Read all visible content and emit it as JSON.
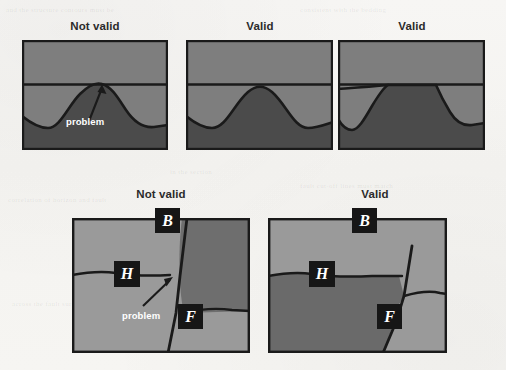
{
  "figure": {
    "background_color": "#f6f5f3",
    "ink_color": "#1a1a1a",
    "light_gray": "#7e7e7e",
    "dark_gray": "#4b4b4b",
    "pale_gray": "#9a9a9a"
  },
  "ghost_text": [
    {
      "text": "and the structure contours must be",
      "x": 6,
      "y": 6
    },
    {
      "text": "consistent with the bedding",
      "x": 300,
      "y": 6
    },
    {
      "text": "in the section",
      "x": 170,
      "y": 168
    },
    {
      "text": "fault cut-off lines must match",
      "x": 300,
      "y": 182
    },
    {
      "text": "correlation of horizon and fault",
      "x": 8,
      "y": 196
    },
    {
      "text": "across the fault surface",
      "x": 12,
      "y": 300
    },
    {
      "text": "geometry of the hanging wall",
      "x": 300,
      "y": 330
    }
  ],
  "top_row": {
    "panels": [
      {
        "id": "top-panel-1",
        "title": "Not valid",
        "title_x": 60,
        "title_y": 20,
        "title_w": 70,
        "rect": {
          "x": 22,
          "y": 40,
          "w": 146,
          "h": 110
        },
        "annotation": {
          "label": "problem",
          "x": 66,
          "y": 116
        },
        "has_arrow": true
      },
      {
        "id": "top-panel-2",
        "title": "Valid",
        "title_x": 225,
        "title_y": 20,
        "title_w": 70,
        "rect": {
          "x": 186,
          "y": 40,
          "w": 147,
          "h": 110
        },
        "annotation": null,
        "has_arrow": false
      },
      {
        "id": "top-panel-3",
        "title": "Valid",
        "title_x": 377,
        "title_y": 20,
        "title_w": 70,
        "rect": {
          "x": 338,
          "y": 40,
          "w": 147,
          "h": 110
        },
        "annotation": null,
        "has_arrow": false
      }
    ]
  },
  "bottom_row": {
    "panels": [
      {
        "id": "bottom-panel-1",
        "title": "Not valid",
        "title_x": 126,
        "title_y": 188,
        "title_w": 70,
        "rect": {
          "x": 72,
          "y": 218,
          "w": 178,
          "h": 135
        },
        "labels": [
          {
            "text": "B",
            "x": 155,
            "y": 208,
            "w": 25,
            "h": 25
          },
          {
            "text": "H",
            "x": 114,
            "y": 261,
            "w": 26,
            "h": 26
          },
          {
            "text": "F",
            "x": 178,
            "y": 304,
            "w": 25,
            "h": 25
          }
        ],
        "annotation": {
          "label": "problem",
          "x": 122,
          "y": 310
        },
        "has_arrow": true
      },
      {
        "id": "bottom-panel-2",
        "title": "Valid",
        "title_x": 340,
        "title_y": 188,
        "title_w": 70,
        "rect": {
          "x": 268,
          "y": 218,
          "w": 179,
          "h": 135
        },
        "labels": [
          {
            "text": "B",
            "x": 352,
            "y": 208,
            "w": 25,
            "h": 25
          },
          {
            "text": "H",
            "x": 309,
            "y": 261,
            "w": 26,
            "h": 26
          },
          {
            "text": "F",
            "x": 377,
            "y": 304,
            "w": 25,
            "h": 25
          }
        ],
        "annotation": null,
        "has_arrow": false
      }
    ]
  }
}
